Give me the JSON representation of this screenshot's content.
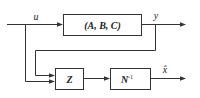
{
  "diagram": {
    "blocks": [
      {
        "id": "plant",
        "label": "(A, B, C)"
      },
      {
        "id": "z",
        "label": "Z"
      },
      {
        "id": "ninv",
        "label": "N",
        "superscript": "-1"
      }
    ],
    "signals": {
      "input": "u",
      "output": "y",
      "estimate": "x̂"
    },
    "colors": {
      "line": "#333333",
      "background": "#ffffff"
    }
  }
}
